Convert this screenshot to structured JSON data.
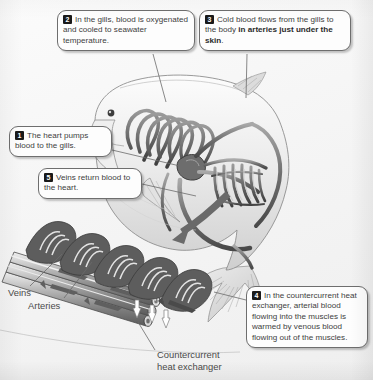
{
  "callouts": [
    {
      "number": "1",
      "id": "callout-1",
      "text": "The heart pumps blood to the gills.",
      "segments": [
        {
          "text": "The heart pumps blood to the gills.",
          "bold": false
        }
      ]
    },
    {
      "number": "2",
      "id": "callout-2",
      "text": "In the gills, blood is oxygenated and cooled to seawater temperature.",
      "segments": [
        {
          "text": "In the gills, blood is oxygenated and cooled to seawater temperature.",
          "bold": false
        }
      ]
    },
    {
      "number": "3",
      "id": "callout-3",
      "text": "Cold blood flows from the gills to the body in arteries just under the skin.",
      "segments": [
        {
          "text": "Cold blood flows from the gills to the body ",
          "bold": false
        },
        {
          "text": "in arteries just under the skin",
          "bold": true
        },
        {
          "text": ".",
          "bold": false
        }
      ]
    },
    {
      "number": "4",
      "id": "callout-4",
      "text": "In the countercurrent heat exchanger, arterial blood flowing into the muscles is warmed  by venous blood flowing out of the muscles.",
      "segments": [
        {
          "text": "In the countercurrent heat exchanger, arterial blood flowing into the muscles is warmed  by venous blood flowing out of the muscles.",
          "bold": false
        }
      ]
    },
    {
      "number": "5",
      "id": "callout-5",
      "text": "Veins return blood to the heart.",
      "segments": [
        {
          "text": "Veins return blood to the heart.",
          "bold": false
        }
      ]
    }
  ],
  "labels": {
    "veins": "Veins",
    "arteries": "Arteries",
    "countercurrent_heat_exchanger": "Countercurrent\nheat exchanger"
  },
  "colors": {
    "background": "#f4f4f4",
    "text": "#3d3d3d",
    "marker_bg": "#1a1a1a",
    "marker_text": "#ffffff",
    "callout_border": "#6e6e6e",
    "vessel_dark": "#5a5a5a",
    "vessel_mid": "#8e8e8e",
    "body_light": "#e8e8e8",
    "arrow": "#6a6a6a"
  },
  "illustration": {
    "fish": "tuna body cutaway, head at left, tail curving down to the right",
    "structures": [
      "gill arches with looping vessels",
      "heart",
      "dorsal and lateral blood vessel network",
      "crescent caudal fin",
      "pectoral fin"
    ],
    "inset": "enlarged countercurrent heat exchanger: parallel artery and vein bundle with capillary loops and white heat-transfer arrows",
    "big_arrow": "curved arrow from fish body down-left to the enlarged exchanger inset"
  }
}
